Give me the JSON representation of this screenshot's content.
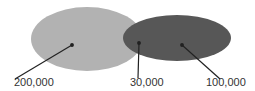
{
  "diagram": {
    "type": "venn",
    "sets": [
      {
        "name": "set-a",
        "fill": "#b2b2b2",
        "label": "200,000"
      },
      {
        "name": "set-b",
        "fill": "#575757",
        "label": "100,000"
      }
    ],
    "overlap": {
      "label": "30,000"
    },
    "colors": {
      "light": "#b2b2b2",
      "dark": "#575757",
      "arrow": "#222222",
      "text": "#333333"
    }
  }
}
